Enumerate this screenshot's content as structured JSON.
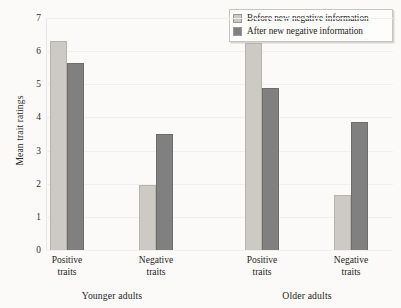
{
  "chart_data": {
    "type": "bar",
    "title": "",
    "subtitle": "",
    "xlabel": "",
    "ylabel": "Mean trait ratings",
    "ylim": [
      0,
      7
    ],
    "yticks": [
      0,
      1,
      2,
      3,
      4,
      5,
      6,
      7
    ],
    "ytick_labels": [
      "0",
      "1",
      "2",
      "3",
      "4",
      "5",
      "6",
      "7"
    ],
    "grid": false,
    "legend_position": "top-right",
    "panels": [
      {
        "name": "Younger adults",
        "categories": [
          "Positive traits",
          "Negative traits"
        ],
        "category_lines": [
          [
            "Positive",
            "traits"
          ],
          [
            "Negative",
            "traits"
          ]
        ]
      },
      {
        "name": "Older adults",
        "categories": [
          "Positive traits",
          "Negative traits"
        ],
        "category_lines": [
          [
            "Positive",
            "traits"
          ],
          [
            "Negative",
            "traits"
          ]
        ]
      }
    ],
    "series": [
      {
        "name": "Before new negative information",
        "color": "#cdcac5",
        "values": [
          6.3,
          1.95,
          6.25,
          1.65
        ]
      },
      {
        "name": "After new negative information",
        "color": "#818080",
        "values": [
          5.65,
          3.5,
          4.9,
          3.85
        ]
      }
    ],
    "groups": [
      {
        "panel": "Younger adults",
        "category": "Positive traits",
        "before": 6.3,
        "after": 5.65
      },
      {
        "panel": "Younger adults",
        "category": "Negative traits",
        "before": 1.95,
        "after": 3.5
      },
      {
        "panel": "Older adults",
        "category": "Positive traits",
        "before": 6.25,
        "after": 4.9
      },
      {
        "panel": "Older adults",
        "category": "Negative traits",
        "before": 1.65,
        "after": 3.85
      }
    ]
  },
  "legend": {
    "items": [
      {
        "label": "Before new negative information",
        "color": "#cdcac5"
      },
      {
        "label": "After new negative information",
        "color": "#818080"
      }
    ]
  },
  "axis": {
    "y_title": "Mean trait ratings",
    "y_labels": [
      "7",
      "6",
      "5",
      "4",
      "3",
      "2",
      "1",
      "0"
    ]
  },
  "labels": {
    "younger_positive_line1": "Positive",
    "younger_positive_line2": "traits",
    "younger_negative_line1": "Negative",
    "younger_negative_line2": "traits",
    "older_positive_line1": "Positive",
    "older_positive_line2": "traits",
    "older_negative_line1": "Negative",
    "older_negative_line2": "traits",
    "panel_younger": "Younger adults",
    "panel_older": "Older adults"
  }
}
